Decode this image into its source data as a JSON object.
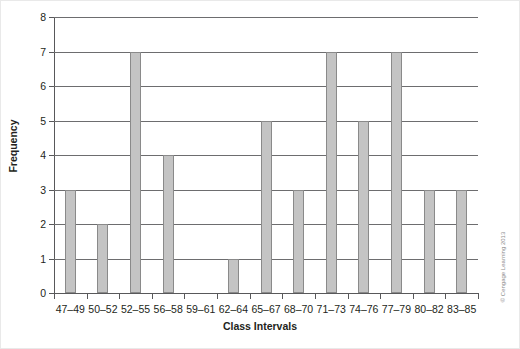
{
  "chart_data": {
    "type": "bar",
    "title": "",
    "xlabel": "Class Intervals",
    "ylabel": "Frequency",
    "categories": [
      "47–49",
      "50–52",
      "52–55",
      "56–58",
      "59–61",
      "62–64",
      "65–67",
      "68–70",
      "71–73",
      "74–76",
      "77–79",
      "80–82",
      "83–85"
    ],
    "values": [
      3,
      2,
      7,
      4,
      0,
      1,
      5,
      3,
      7,
      5,
      7,
      3,
      3
    ],
    "ylim": [
      0,
      8
    ],
    "ytick_labels": [
      "0",
      "1",
      "2",
      "3",
      "4",
      "5",
      "6",
      "7",
      "8"
    ],
    "ytick_values": [
      0,
      1,
      2,
      3,
      4,
      5,
      6,
      7,
      8
    ],
    "grid": true,
    "legend": false,
    "bar_color": "#c4c4c4",
    "bar_border_color": "#8a8a8a",
    "axis_color": "#58585a",
    "grid_color": "#6d6d6f"
  },
  "credit": "© Cengage Learning 2013"
}
